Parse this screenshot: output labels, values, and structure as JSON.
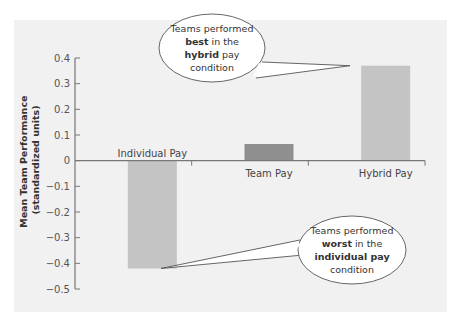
{
  "chart_data": {
    "type": "bar",
    "title": "",
    "xlabel": "",
    "ylabel": "Mean Team Performance",
    "ylabel_sub": "(standardized units)",
    "categories": [
      "Individual Pay",
      "Team Pay",
      "Hybrid Pay"
    ],
    "values": [
      -0.42,
      0.065,
      0.37
    ],
    "ylim": [
      -0.5,
      0.4
    ],
    "yticks": [
      0.4,
      0.3,
      0.2,
      0.1,
      0,
      -0.1,
      -0.2,
      -0.3,
      -0.4,
      -0.5
    ],
    "ytick_labels": [
      "0.4",
      "0.3",
      "0.2",
      "0.1",
      "0",
      "-0.1",
      "-0.2",
      "-0.3",
      "-0.4",
      "-0.5"
    ],
    "grid": false,
    "colors": {
      "panel_bg": "#f1f1f1",
      "bar_light": "#c4c4c4",
      "bar_dark": "#8f8f8f",
      "axis": "#777777"
    },
    "bar_colors": [
      "#c4c4c4",
      "#8f8f8f",
      "#c4c4c4"
    ],
    "annotations": [
      {
        "target": "Hybrid Pay",
        "lines": [
          [
            {
              "t": "Teams performed",
              "b": false
            }
          ],
          [
            {
              "t": "best",
              "b": true
            },
            {
              "t": " in the",
              "b": false
            }
          ],
          [
            {
              "t": "hybrid",
              "b": true
            },
            {
              "t": " pay",
              "b": false
            }
          ],
          [
            {
              "t": "condition",
              "b": false
            }
          ]
        ]
      },
      {
        "target": "Individual Pay",
        "lines": [
          [
            {
              "t": "Teams performed",
              "b": false
            }
          ],
          [
            {
              "t": "worst",
              "b": true
            },
            {
              "t": " in the",
              "b": false
            }
          ],
          [
            {
              "t": "individual pay",
              "b": true
            }
          ],
          [
            {
              "t": "condition",
              "b": false
            }
          ]
        ]
      }
    ]
  }
}
